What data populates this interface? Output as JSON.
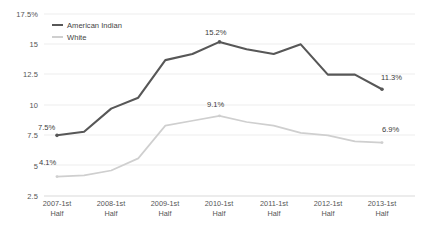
{
  "chart_data": {
    "type": "line",
    "title": "",
    "xlabel": "",
    "ylabel": "",
    "ylim": [
      2.5,
      17.5
    ],
    "grid": true,
    "legend_position": "top-left",
    "categories": [
      "2007-1st Half",
      "2007-2nd Half",
      "2008-1st Half",
      "2008-2nd Half",
      "2009-1st Half",
      "2009-2nd Half",
      "2010-1st Half",
      "2010-2nd Half",
      "2011-1st Half",
      "2011-2nd Half",
      "2012-1st Half",
      "2012-2nd Half",
      "2013-1st Half"
    ],
    "x_tick_labels": [
      {
        "line1": "2007-1st",
        "line2": "Half"
      },
      {
        "line1": "2008-1st",
        "line2": "Half"
      },
      {
        "line1": "2009-1st",
        "line2": "Half"
      },
      {
        "line1": "2010-1st",
        "line2": "Half"
      },
      {
        "line1": "2011-1st",
        "line2": "Half"
      },
      {
        "line1": "2012-1st",
        "line2": "Half"
      },
      {
        "line1": "2013-1st",
        "line2": "Half"
      }
    ],
    "y_tick_labels": [
      "17.5%",
      "15",
      "12.5",
      "10",
      "7.5",
      "5",
      "2.5"
    ],
    "y_tick_values": [
      17.5,
      15,
      12.5,
      10,
      7.5,
      5,
      2.5
    ],
    "series": [
      {
        "name": "American Indian",
        "color": "#575757",
        "values": [
          7.5,
          7.8,
          9.7,
          10.6,
          13.7,
          14.2,
          15.2,
          14.6,
          14.2,
          15.0,
          12.5,
          12.5,
          11.3
        ],
        "labels": [
          {
            "index": 0,
            "text": "7.5%"
          },
          {
            "index": 6,
            "text": "15.2%"
          },
          {
            "index": 12,
            "text": "11.3%"
          }
        ]
      },
      {
        "name": "White",
        "color": "#cfcfcf",
        "values": [
          4.1,
          4.2,
          4.6,
          5.6,
          8.3,
          8.7,
          9.1,
          8.6,
          8.3,
          7.7,
          7.5,
          7.0,
          6.9
        ],
        "labels": [
          {
            "index": 0,
            "text": "4.1%"
          },
          {
            "index": 6,
            "text": "9.1%"
          },
          {
            "index": 12,
            "text": "6.9%"
          }
        ]
      }
    ]
  },
  "legend": {
    "items": [
      {
        "label": "American Indian",
        "color": "#575757"
      },
      {
        "label": "White",
        "color": "#cfcfcf"
      }
    ]
  },
  "y_axis": {
    "t0": "17.5%",
    "t1": "15",
    "t2": "12.5",
    "t3": "10",
    "t4": "7.5",
    "t5": "5",
    "t6": "2.5"
  },
  "x_axis": {
    "l0a": "2007-1st",
    "l0b": "Half",
    "l1a": "2008-1st",
    "l1b": "Half",
    "l2a": "2009-1st",
    "l2b": "Half",
    "l3a": "2010-1st",
    "l3b": "Half",
    "l4a": "2011-1st",
    "l4b": "Half",
    "l5a": "2012-1st",
    "l5b": "Half",
    "l6a": "2013-1st",
    "l6b": "Half"
  },
  "annotations": {
    "ai_start": "7.5%",
    "ai_peak": "15.2%",
    "ai_end": "11.3%",
    "wh_start": "4.1%",
    "wh_peak": "9.1%",
    "wh_end": "6.9%"
  }
}
